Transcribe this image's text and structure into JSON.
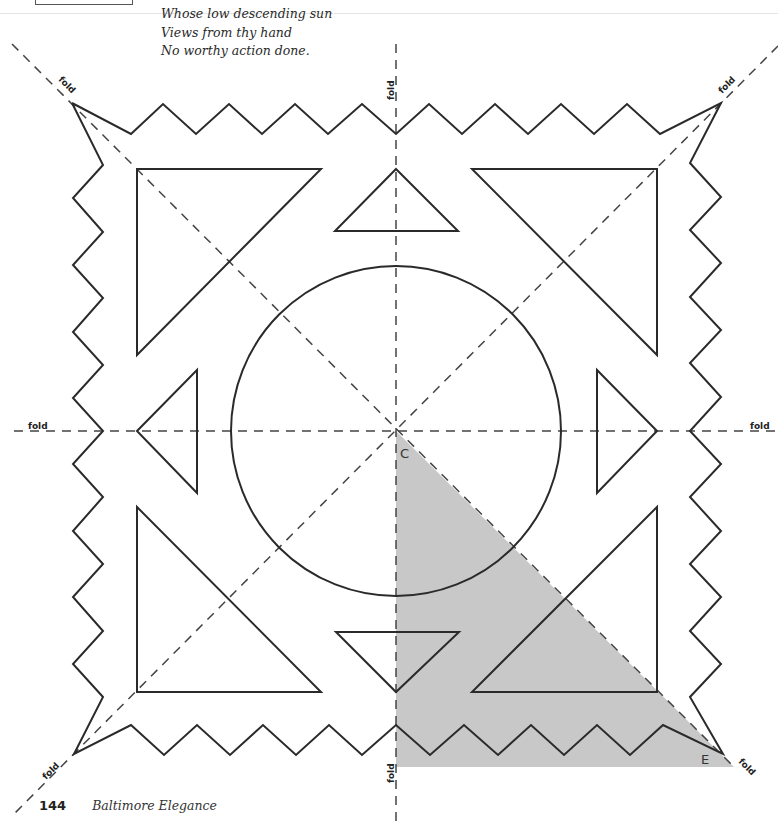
{
  "poem": {
    "lines": [
      "Whose low descending sun",
      "Views from thy hand",
      "No worthy action done."
    ]
  },
  "diagram": {
    "fold_labels": {
      "top": "fold",
      "bottom": "fold",
      "left": "fold",
      "right": "fold",
      "top_left": "fold",
      "top_right": "fold",
      "bottom_left": "fold",
      "bottom_right": "fold"
    },
    "point_labels": {
      "center": "C",
      "corner": "E"
    },
    "colors": {
      "stroke": "#2a2a2a",
      "dash": "#444444",
      "shaded_region": "#c8c8c8"
    }
  },
  "footer": {
    "page_number": "144",
    "book_title": "Baltimore Elegance"
  }
}
